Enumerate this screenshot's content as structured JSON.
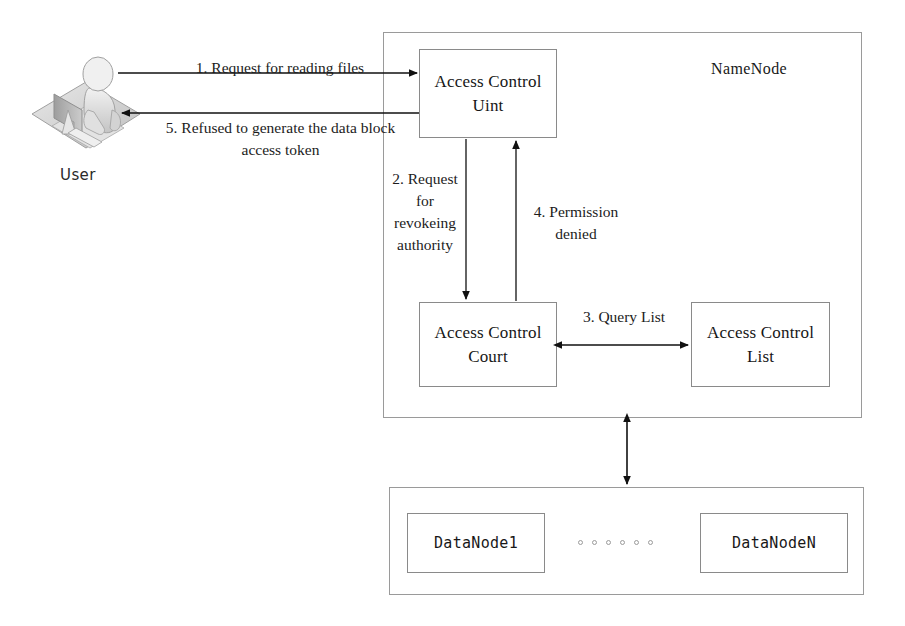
{
  "diagram": {
    "title_namenode": "NameNode",
    "user_caption": "User",
    "nodes": {
      "access_control_unit": "Access Control\nUint",
      "access_control_court": "Access Control\nCourt",
      "access_control_list": "Access Control\nList",
      "datanode_first": "DataNode1",
      "datanode_last": "DataNodeN"
    },
    "flows": [
      {
        "id": "flow-1",
        "label": "1. Request for reading files",
        "from": "User",
        "to": "Access Control Uint",
        "direction": "right"
      },
      {
        "id": "flow-5",
        "label": "5. Refused to generate the data block\naccess token",
        "from": "Access Control Uint",
        "to": "User",
        "direction": "left"
      },
      {
        "id": "flow-2",
        "label": "2. Request\nfor\nrevokeing\nauthority",
        "from": "Access Control Uint",
        "to": "Access Control Court",
        "direction": "down"
      },
      {
        "id": "flow-4",
        "label": "4. Permission\ndenied",
        "from": "Access Control Court",
        "to": "Access Control Uint",
        "direction": "up"
      },
      {
        "id": "flow-3",
        "label": "3. Query List",
        "from": "Access Control Court",
        "to": "Access Control List",
        "direction": "bidirectional"
      },
      {
        "id": "flow-namenode-datanode",
        "label": "",
        "from": "NameNode",
        "to": "DataNodes",
        "direction": "bidirectional-vertical"
      }
    ],
    "ellipsis_dot_count": 6,
    "colors": {
      "line": "#1a1a1a",
      "box_border": "#8c8c8c",
      "text": "#1a1a1a",
      "background": "#ffffff",
      "icon_light": "#dcdcdc",
      "icon_mid": "#b4b4b4",
      "icon_dark": "#8d8d8d"
    }
  }
}
